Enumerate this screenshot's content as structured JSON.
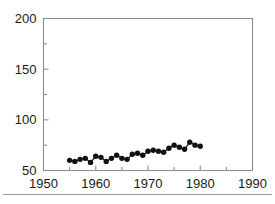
{
  "chart_data": {
    "type": "line",
    "title": "",
    "subtitle": "",
    "xlabel": "",
    "ylabel": "",
    "xlim": [
      1950,
      1990
    ],
    "ylim": [
      50,
      200
    ],
    "grid": false,
    "legend": null,
    "marker": "filled-circle",
    "x_ticks": [
      1950,
      1960,
      1970,
      1980,
      1990
    ],
    "x_tick_labels": [
      "1950",
      "1960",
      "1970",
      "1980",
      "1990"
    ],
    "x_minor_ticks": [
      1955,
      1965,
      1975,
      1985
    ],
    "y_ticks": [
      50,
      100,
      150,
      200
    ],
    "y_tick_labels": [
      "50",
      "100",
      "150",
      "200"
    ],
    "y_minor_ticks": [
      75,
      125,
      175
    ],
    "x": [
      1955,
      1956,
      1957,
      1958,
      1959,
      1960,
      1961,
      1962,
      1963,
      1964,
      1965,
      1966,
      1967,
      1968,
      1969,
      1970,
      1971,
      1972,
      1973,
      1974,
      1975,
      1976,
      1977,
      1978,
      1979,
      1980
    ],
    "values": [
      60,
      59,
      61,
      62,
      58,
      64,
      63,
      59,
      62,
      65,
      62,
      61,
      66,
      67,
      65,
      69,
      70,
      69,
      68,
      72,
      75,
      73,
      71,
      78,
      75,
      74
    ],
    "series": [
      {
        "name": "series-1",
        "values": [
          60,
          59,
          61,
          62,
          58,
          64,
          63,
          59,
          62,
          65,
          62,
          61,
          66,
          67,
          65,
          69,
          70,
          69,
          68,
          72,
          75,
          73,
          71,
          78,
          75,
          74
        ]
      }
    ]
  },
  "axes": {
    "frame_color": "#8c8c8c",
    "data_color": "#111111",
    "text_color": "#1a1a1a"
  }
}
